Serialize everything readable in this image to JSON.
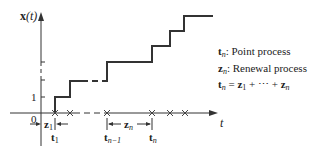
{
  "diagram": {
    "type": "step-function-plot",
    "y_axis_label": "x(t)",
    "x_axis_label": "t",
    "y_tick_label": "1",
    "origin_label": "0",
    "interval_labels": {
      "first": "z1",
      "nth": "zn"
    },
    "time_labels": [
      "t1",
      "tn-1",
      "tn"
    ],
    "event_markers_x": [
      55,
      70,
      107,
      152,
      170,
      185
    ]
  },
  "legend": {
    "items": [
      {
        "symbol": "t",
        "sub": "n",
        "sep": ":",
        "text": "Point process"
      },
      {
        "symbol": "z",
        "sub": "n",
        "sep": ":",
        "text": "Renewal process"
      }
    ],
    "formula": {
      "lhs": "t",
      "lhs_sub": "n",
      "eq": " = ",
      "t1": "z",
      "t1_sub": "1",
      "mid": " + ⋯ + ",
      "t2": "z",
      "t2_sub": "n"
    }
  },
  "labels": {
    "y_axis_main": "x",
    "y_axis_arg": "(t)",
    "x_axis": "t",
    "tick_one": "1",
    "origin": "0",
    "z1_main": "z",
    "z1_sub": "1",
    "zn_main": "z",
    "zn_sub": "n",
    "t1_main": "t",
    "t1_sub": "1",
    "tn1_main": "t",
    "tn1_sub": "n−1",
    "tn_main": "t",
    "tn_sub": "n"
  }
}
